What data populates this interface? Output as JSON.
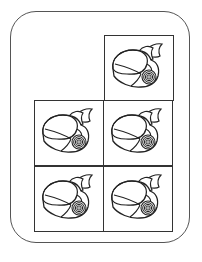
{
  "figure": {
    "grid": {
      "rows": 3,
      "cols": 2
    },
    "cells": [
      {
        "row": 0,
        "col": 1,
        "icon": "shell-icon"
      },
      {
        "row": 1,
        "col": 0,
        "icon": "shell-icon"
      },
      {
        "row": 1,
        "col": 1,
        "icon": "shell-icon"
      },
      {
        "row": 2,
        "col": 0,
        "icon": "shell-icon"
      },
      {
        "row": 2,
        "col": 1,
        "icon": "shell-icon"
      }
    ],
    "count": 5,
    "colors": {
      "stroke": "#222222",
      "frame": "#555555",
      "background": "#ffffff"
    }
  }
}
